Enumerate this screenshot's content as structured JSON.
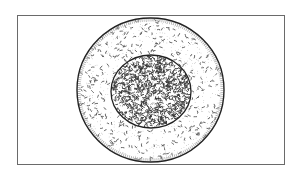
{
  "diagram": {
    "canvas": {
      "width": 299,
      "height": 172,
      "background": "#ffffff"
    },
    "frame": {
      "x": 17,
      "y": 15,
      "width": 267,
      "height": 149,
      "stroke": "#6a6a6a",
      "stroke_width": 1
    },
    "outer_circle": {
      "cx": 150.5,
      "cy": 90,
      "rx": 73.5,
      "ry": 72,
      "stroke": "#222222",
      "stroke_width": 1.4,
      "fill": "#ffffff",
      "stipple_color": "#555555",
      "stipple_density": "sparse"
    },
    "inner_circle": {
      "cx": 151,
      "cy": 91.5,
      "rx": 40,
      "ry": 36.5,
      "stroke": "#222222",
      "stroke_width": 1.3,
      "fill": "#ffffff",
      "stipple_color": "#333333",
      "stipple_density": "dense"
    }
  }
}
